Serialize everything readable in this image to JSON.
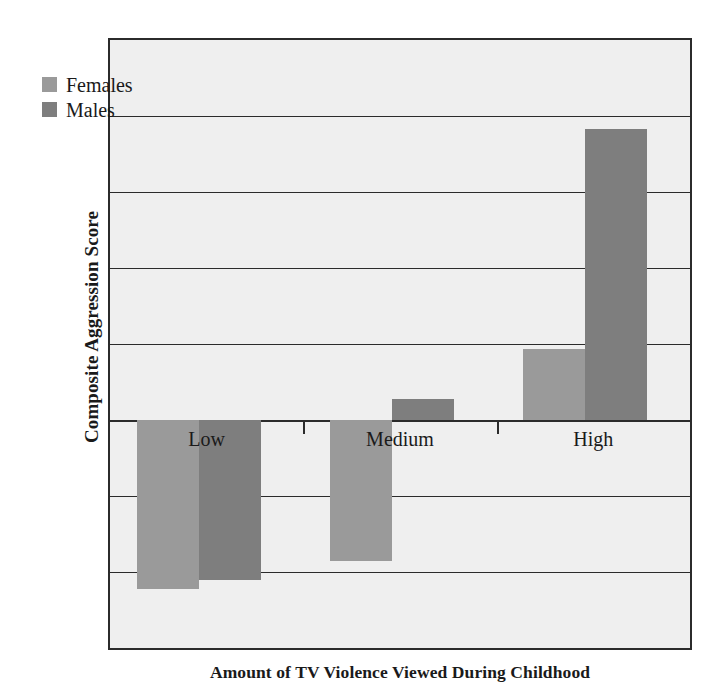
{
  "chart_data": {
    "type": "bar",
    "title": "",
    "xlabel": "Amount of TV Violence Viewed During Childhood",
    "ylabel": "Composite Aggression Score",
    "categories": [
      "Low",
      "Medium",
      "High"
    ],
    "series": [
      {
        "name": "Females",
        "color": "#9a9a9a",
        "values": [
          -0.222,
          -0.185,
          0.093
        ]
      },
      {
        "name": "Males",
        "color": "#7e7e7e",
        "values": [
          -0.21,
          0.028,
          0.383
        ]
      }
    ],
    "ylim": [
      -0.3,
      0.5
    ],
    "ytick_values": [
      0.5,
      0.4,
      0.3,
      0.2,
      0.1,
      0,
      -0.1,
      -0.2,
      -0.3
    ],
    "ytick_labels": [
      "0.5",
      "0.4",
      "0.3",
      "0.2",
      "0.1",
      "0",
      "−0.1",
      "−0.2",
      "−0.3"
    ],
    "grid": true,
    "legend_position": "top-left",
    "zero_line": 0,
    "plot_background": "#efefef",
    "axis_color": "#2b2b2b"
  },
  "legend": {
    "items": [
      {
        "label": "Females",
        "color": "#9a9a9a"
      },
      {
        "label": "Males",
        "color": "#7e7e7e"
      }
    ]
  },
  "axis_titles": {
    "y": "Composite Aggression Score",
    "x": "Amount of TV Violence Viewed During Childhood"
  }
}
